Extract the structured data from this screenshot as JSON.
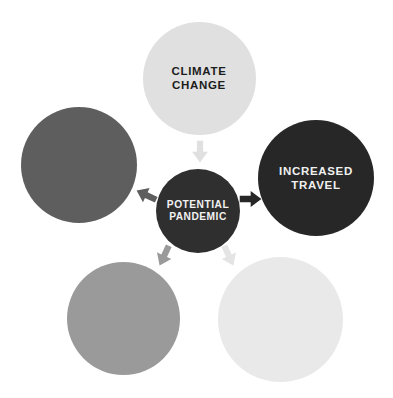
{
  "diagram": {
    "background_color": "#ffffff",
    "center": {
      "id": "potential-pandemic",
      "label": "POTENTIAL\nPANDEMIC",
      "fill": "#302f2f",
      "text_color": "#f2f2f2",
      "cx": 198,
      "cy": 211,
      "diameter": 84
    },
    "nodes": [
      {
        "id": "climate-change",
        "label": "CLIMATE\nCHANGE",
        "position": "top",
        "fill": "#e0e0e0",
        "text_color": "#1c1c1c",
        "cx": 199,
        "cy": 78,
        "diameter": 113
      },
      {
        "id": "increased-travel",
        "label": "INCREASED\nTRAVEL",
        "position": "right",
        "fill": "#272727",
        "text_color": "#f0f0f0",
        "cx": 316,
        "cy": 178,
        "diameter": 116
      },
      {
        "id": "unlabeled-left",
        "label": "",
        "position": "left",
        "fill": "#5e5e5e",
        "text_color": "#ffffff",
        "cx": 79,
        "cy": 165,
        "diameter": 116
      },
      {
        "id": "unlabeled-bottom-left",
        "label": "",
        "position": "bottom-left",
        "fill": "#9a9a9a",
        "text_color": "#ffffff",
        "cx": 123,
        "cy": 318,
        "diameter": 113
      },
      {
        "id": "unlabeled-bottom-right",
        "label": "",
        "position": "bottom-right",
        "fill": "#e9e9e9",
        "text_color": "#1c1c1c",
        "cx": 280,
        "cy": 319,
        "diameter": 125
      }
    ],
    "arrows": [
      {
        "id": "arrow-climate-change-to-center",
        "from": "climate-change",
        "to": "potential-pandemic",
        "direction": "down",
        "fill": "#e0e0e0",
        "x": 187,
        "y": 139,
        "rotation": 0
      },
      {
        "id": "arrow-increased-travel-to-center",
        "from": "increased-travel",
        "to": "potential-pandemic",
        "direction": "left",
        "fill": "#272727",
        "x": 238,
        "y": 186,
        "rotation": 270
      },
      {
        "id": "arrow-unlabeled-left-to-center",
        "from": "unlabeled-left",
        "to": "potential-pandemic",
        "direction": "right-down",
        "fill": "#5e5e5e",
        "x": 133,
        "y": 182,
        "rotation": 115
      },
      {
        "id": "arrow-unlabeled-bottom-left-to-center",
        "from": "unlabeled-bottom-left",
        "to": "potential-pandemic",
        "direction": "up-right",
        "fill": "#9a9a9a",
        "x": 151,
        "y": 243,
        "rotation": 25
      },
      {
        "id": "arrow-unlabeled-bottom-right-to-center",
        "from": "unlabeled-bottom-right",
        "to": "potential-pandemic",
        "direction": "up-left",
        "fill": "#e4e4e4",
        "x": 216,
        "y": 243,
        "rotation": -25
      }
    ]
  }
}
